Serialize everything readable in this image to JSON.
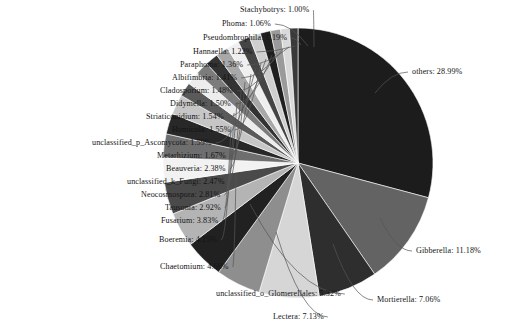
{
  "chart_data": {
    "type": "pie",
    "title": "",
    "xlabel": "",
    "ylabel": "",
    "legend_position": "none",
    "label_format": "{name}: {value}%",
    "start_angle_deg": 0,
    "direction": "clockwise",
    "categories": [
      "others",
      "Gibberella",
      "Mortierella",
      "Lectera",
      "unclassified_o_Glomerellales",
      "Chaetomium",
      "Boeremia",
      "Fusarium",
      "Tausonia",
      "Neocosmospora",
      "unclassified_k_Fungi",
      "Beauveria",
      "Metarhizium",
      "unclassified_p_Ascomycota",
      "Humicola",
      "Striaticonidium",
      "Didymella",
      "Cladosporium",
      "Albifimbria",
      "Paraphoma",
      "Hannaella",
      "Pseudombrophila",
      "Phoma",
      "Stachybotrys"
    ],
    "values": [
      28.99,
      11.18,
      7.06,
      7.13,
      5.32,
      4.66,
      4.15,
      3.83,
      2.92,
      2.81,
      2.47,
      2.38,
      1.67,
      1.59,
      1.55,
      1.54,
      1.5,
      1.48,
      1.41,
      1.36,
      1.22,
      1.19,
      1.06,
      1.0
    ],
    "colors": [
      "#1c1c1c",
      "#636363",
      "#2e2e2e",
      "#d6d6d6",
      "#8e8e8e",
      "#212121",
      "#b4b4b4",
      "#4a4a4a",
      "#f2f2f2",
      "#6e6e6e",
      "#282828",
      "#c6c6c6",
      "#5a5a5a",
      "#ededed",
      "#7c7c7c",
      "#333333",
      "#a8a8a8",
      "#efefef",
      "#454545",
      "#cfcfcf",
      "#1f1f1f",
      "#9a9a9a",
      "#d9d9d9",
      "#3a3a3a"
    ],
    "units": "%"
  },
  "labels": [
    {
      "name": "Stachybotrys",
      "value": "1.00%",
      "text": "Stachybotrys:  1.00%"
    },
    {
      "name": "Phoma",
      "value": "1.06%",
      "text": "Phoma:  1.06%"
    },
    {
      "name": "Pseudombrophila",
      "value": "1.19%",
      "text": "Pseudombrophila:  1.19%"
    },
    {
      "name": "Hannaella",
      "value": "1.22%",
      "text": "Hannaella:  1.22%"
    },
    {
      "name": "Paraphoma",
      "value": "1.36%",
      "text": "Paraphoma:  1.36%"
    },
    {
      "name": "Albifimbria",
      "value": "1.41%",
      "text": "Albifimbria:  1.41%"
    },
    {
      "name": "Cladosporium",
      "value": "1.48%",
      "text": "Cladosporium:  1.48%"
    },
    {
      "name": "Didymella",
      "value": "1.50%",
      "text": "Didymella:  1.50%"
    },
    {
      "name": "Striaticonidium",
      "value": "1.54%",
      "text": "Striaticonidium:  1.54%"
    },
    {
      "name": "Humicola",
      "value": "1.55%",
      "text": "Humicola:  1.55%"
    },
    {
      "name": "unclassified_p_Ascomycota",
      "value": "1.59%",
      "text": "unclassified_p_Ascomycota:  1.59%"
    },
    {
      "name": "Metarhizium",
      "value": "1.67%",
      "text": "Metarhizium:  1.67%"
    },
    {
      "name": "Beauveria",
      "value": "2.38%",
      "text": "Beauveria:  2.38%"
    },
    {
      "name": "unclassified_k_Fungi",
      "value": "2.47%",
      "text": "unclassified_k_Fungi:  2.47%"
    },
    {
      "name": "Neocosmospora",
      "value": "2.81%",
      "text": "Neocosmospora:  2.81%"
    },
    {
      "name": "Tausonia",
      "value": "2.92%",
      "text": "Tausonia:  2.92%"
    },
    {
      "name": "Fusarium",
      "value": "3.83%",
      "text": "Fusarium:  3.83%"
    },
    {
      "name": "Boeremia",
      "value": "4.15%",
      "text": "Boeremia:  4.15%"
    },
    {
      "name": "Chaetomium",
      "value": "4.66%",
      "text": "Chaetomium:  4.66%"
    },
    {
      "name": "unclassified_o_Glomerellales",
      "value": "5.32%",
      "text": "unclassified_o_Glomerellales:  5.32%"
    },
    {
      "name": "Lectera",
      "value": "7.13%",
      "text": "Lectera:  7.13%"
    },
    {
      "name": "Mortierella",
      "value": "7.06%",
      "text": "Mortierella:  7.06%"
    },
    {
      "name": "Gibberella",
      "value": "11.18%",
      "text": "Gibberella:  11.18%"
    },
    {
      "name": "others",
      "value": "28.99%",
      "text": "others:  28.99%"
    }
  ],
  "label_positions": [
    {
      "key": "Stachybotrys",
      "side": "left",
      "x": 240,
      "y": 6,
      "anchor_x": 314,
      "anchor_y": 47
    },
    {
      "key": "Phoma",
      "side": "left",
      "x": 222,
      "y": 20,
      "anchor_x": 308,
      "anchor_y": 46
    },
    {
      "key": "Pseudombrophila",
      "side": "left",
      "x": 203,
      "y": 34,
      "anchor_x": 301,
      "anchor_y": 45
    },
    {
      "key": "Hannaella",
      "side": "left",
      "x": 193,
      "y": 48,
      "anchor_x": 295,
      "anchor_y": 46
    },
    {
      "key": "Paraphoma",
      "side": "left",
      "x": 180,
      "y": 61,
      "anchor_x": 289,
      "anchor_y": 47
    },
    {
      "key": "Albifimbria",
      "side": "left",
      "x": 172,
      "y": 74,
      "anchor_x": 283,
      "anchor_y": 49
    },
    {
      "key": "Cladosporium",
      "side": "left",
      "x": 160,
      "y": 87,
      "anchor_x": 277,
      "anchor_y": 52
    },
    {
      "key": "Didymella",
      "side": "left",
      "x": 170,
      "y": 100,
      "anchor_x": 272,
      "anchor_y": 55
    },
    {
      "key": "Striaticonidium",
      "side": "left",
      "x": 146,
      "y": 113,
      "anchor_x": 266,
      "anchor_y": 59
    },
    {
      "key": "Humicola",
      "side": "left",
      "x": 172,
      "y": 126,
      "anchor_x": 261,
      "anchor_y": 63
    },
    {
      "key": "unclassified_p_Ascomycota",
      "side": "left",
      "x": 92,
      "y": 139,
      "anchor_x": 256,
      "anchor_y": 68
    },
    {
      "key": "Metarhizium",
      "side": "left",
      "x": 157,
      "y": 152,
      "anchor_x": 251,
      "anchor_y": 74
    },
    {
      "key": "Beauveria",
      "side": "left",
      "x": 166,
      "y": 165,
      "anchor_x": 245,
      "anchor_y": 82
    },
    {
      "key": "unclassified_k_Fungi",
      "side": "left",
      "x": 127,
      "y": 178,
      "anchor_x": 241,
      "anchor_y": 91
    },
    {
      "key": "Neocosmospora",
      "side": "left",
      "x": 141,
      "y": 191,
      "anchor_x": 237,
      "anchor_y": 102
    },
    {
      "key": "Tausonia",
      "side": "left",
      "x": 165,
      "y": 204,
      "anchor_x": 234,
      "anchor_y": 113
    },
    {
      "key": "Fusarium",
      "side": "left",
      "x": 161,
      "y": 217,
      "anchor_x": 231,
      "anchor_y": 127
    },
    {
      "key": "Boeremia",
      "side": "left",
      "x": 159,
      "y": 236,
      "anchor_x": 231,
      "anchor_y": 147
    },
    {
      "key": "Chaetomium",
      "side": "left",
      "x": 160,
      "y": 263,
      "anchor_x": 236,
      "anchor_y": 174
    },
    {
      "key": "unclassified_o_Glomerellales",
      "side": "left",
      "x": 216,
      "y": 290,
      "anchor_x": 250,
      "anchor_y": 204
    },
    {
      "key": "Lectera",
      "side": "left",
      "x": 273,
      "y": 313,
      "anchor_x": 276,
      "anchor_y": 232
    },
    {
      "key": "Mortierella",
      "side": "right",
      "x": 377,
      "y": 296,
      "anchor_x": 333,
      "anchor_y": 244
    },
    {
      "key": "Gibberella",
      "side": "right",
      "x": 416,
      "y": 247,
      "anchor_x": 380,
      "anchor_y": 218
    },
    {
      "key": "others",
      "side": "right",
      "x": 412,
      "y": 68,
      "anchor_x": 375,
      "anchor_y": 93
    }
  ]
}
